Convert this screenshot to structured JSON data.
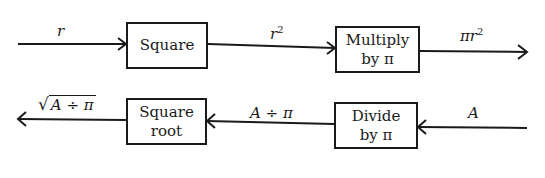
{
  "diagram": {
    "type": "flow",
    "forward_row": {
      "input_label": "r",
      "boxes": [
        {
          "id": "square",
          "lines": [
            "Square"
          ]
        },
        {
          "id": "multiply",
          "lines": [
            "Multiply",
            "by π"
          ]
        }
      ],
      "intermediate_label": "r²",
      "intermediate_base": "r",
      "intermediate_exp": "2",
      "output_label": "πr²",
      "output_base": "πr",
      "output_exp": "2"
    },
    "inverse_row": {
      "input_label": "A",
      "boxes": [
        {
          "id": "divide",
          "lines": [
            "Divide",
            "by π"
          ]
        },
        {
          "id": "square-root",
          "lines": [
            "Square",
            "root"
          ]
        }
      ],
      "intermediate_label": "A ÷ π",
      "output_label": "√(A ÷ π)",
      "output_radicand": "A ÷ π",
      "output_radical": "√"
    },
    "colors": {
      "stroke": "#1a1a1a",
      "background": "#ffffff"
    }
  }
}
